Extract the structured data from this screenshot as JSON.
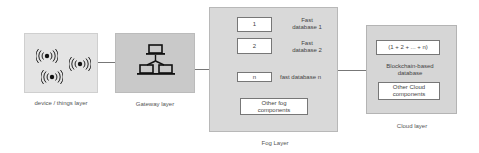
{
  "layers": {
    "device": {
      "caption": "device / things layer",
      "icon": "wireless-signal-icon",
      "icon_count": 3
    },
    "gateway": {
      "caption": "Gateway layer",
      "icon": "network-topology-icon"
    },
    "fog": {
      "caption": "Fog Layer",
      "databases": [
        {
          "box": "1",
          "label_line1": "Fast",
          "label_line2": "database 1"
        },
        {
          "box": "2",
          "label_line1": "Fast",
          "label_line2": "database 2"
        },
        {
          "box": "n",
          "label": "fast database n"
        }
      ],
      "other_line1": "Other fog",
      "other_line2": "components"
    },
    "cloud": {
      "caption": "Cloud layer",
      "aggregate_box": "(1 + 2 + ... + n)",
      "db_label_line1": "Blockchain-based",
      "db_label_line2": "database",
      "other_line1": "Other Cloud",
      "other_line2": "components"
    }
  },
  "colors": {
    "device_fill": "#e4e4e4",
    "gateway_fill": "#c9c9c9",
    "fog_fill": "#d9d9d9",
    "cloud_fill": "#d6d6d6",
    "connector": "#777777"
  }
}
